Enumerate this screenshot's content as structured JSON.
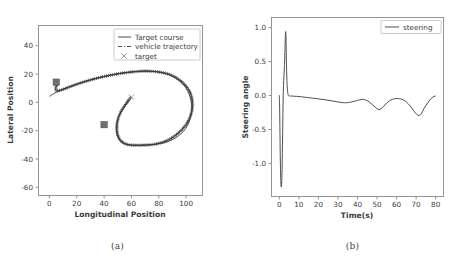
{
  "figure": {
    "panels": [
      {
        "caption": "(a)",
        "chart_data": {
          "type": "line",
          "title": "",
          "xlabel": "Longitudinal Position",
          "ylabel": "Lateral Position",
          "xlim": [
            -8,
            112
          ],
          "ylim": [
            -70,
            50
          ],
          "xticks": [
            0,
            20,
            40,
            60,
            80,
            100
          ],
          "yticks": [
            -60,
            -40,
            -20,
            0,
            20,
            40
          ],
          "grid": false,
          "legend_position": "upper right",
          "legend": [
            "Target course",
            "vehicle trajectory",
            "target"
          ],
          "series": [
            {
              "name": "Target course",
              "style": "solid",
              "x": [
                0,
                2,
                4,
                6,
                8,
                10,
                14,
                18,
                22,
                26,
                30,
                34,
                38,
                42,
                46,
                50,
                54,
                58,
                62,
                66,
                70,
                74,
                78,
                82,
                86,
                90,
                94,
                98,
                101,
                103,
                104,
                104,
                103,
                101,
                98,
                94,
                90,
                86,
                82,
                78,
                74,
                70,
                66,
                62,
                58,
                55,
                52,
                50,
                49,
                49,
                50,
                52,
                55,
                58,
                60
              ],
              "y": [
                0,
                1.2,
                2.4,
                3.4,
                4.3,
                5.1,
                6.6,
                8.0,
                9.3,
                10.5,
                11.6,
                12.6,
                13.5,
                14.4,
                15.2,
                15.9,
                16.5,
                17.0,
                17.4,
                17.7,
                17.8,
                17.7,
                17.4,
                16.8,
                15.8,
                14.2,
                11.8,
                8.2,
                4.0,
                -0.6,
                -5.4,
                -10.6,
                -15.8,
                -20.6,
                -24.8,
                -28.2,
                -30.6,
                -32.2,
                -33.2,
                -33.8,
                -34.2,
                -34.4,
                -34.5,
                -34.5,
                -34.3,
                -33.6,
                -32.0,
                -29.0,
                -25.0,
                -20.5,
                -16.0,
                -11.6,
                -7.4,
                -3.6,
                -0.6
              ]
            },
            {
              "name": "vehicle trajectory",
              "style": "dashed",
              "marker": "plus",
              "x": [
                5.5,
                5.0,
                4.6,
                4.6,
                5.2,
                6.4,
                8.0,
                10.0,
                13.0,
                16.5,
                20.0,
                24.0,
                28.0,
                32.0,
                36.0,
                40.0,
                44.0,
                48.0,
                52.0,
                56.0,
                60.0,
                64.0,
                68.0,
                72.0,
                76.0,
                80.0,
                84.0,
                88.0,
                92.0,
                96.0,
                99.5,
                102.5,
                104.2,
                104.8,
                104.2,
                102.5,
                100.0,
                96.5,
                92.5,
                88.5,
                84.5,
                80.5,
                76.5,
                72.5,
                68.5,
                64.5,
                60.5,
                57.0,
                54.0,
                51.5,
                50.0,
                49.3,
                49.5,
                50.6,
                52.5,
                55.0,
                57.5,
                59.5
              ],
              "y": [
                8.6,
                7.2,
                5.8,
                4.6,
                3.9,
                3.8,
                4.2,
                4.9,
                6.0,
                7.3,
                8.5,
                9.8,
                11.0,
                12.1,
                13.1,
                14.0,
                14.8,
                15.5,
                16.2,
                16.7,
                17.2,
                17.5,
                17.8,
                17.8,
                17.6,
                17.2,
                16.5,
                15.4,
                13.6,
                11.0,
                7.8,
                3.8,
                -0.8,
                -5.8,
                -10.8,
                -15.6,
                -20.0,
                -24.0,
                -27.4,
                -30.0,
                -31.9,
                -33.1,
                -33.9,
                -34.3,
                -34.5,
                -34.6,
                -34.5,
                -34.0,
                -32.8,
                -30.6,
                -27.4,
                -23.4,
                -19.0,
                -14.6,
                -10.4,
                -6.6,
                -3.2,
                -0.6
              ]
            }
          ],
          "point_markers": [
            {
              "name": "target",
              "marker": "x",
              "x": 60,
              "y": -0.6
            }
          ],
          "obstacles": [
            {
              "marker": "square",
              "x": 5,
              "y": 10
            },
            {
              "marker": "square",
              "x": 40,
              "y": -20
            }
          ]
        }
      },
      {
        "caption": "(b)",
        "chart_data": {
          "type": "line",
          "title": "",
          "xlabel": "Time(s)",
          "ylabel": "Steering angle",
          "xlim": [
            -4,
            84
          ],
          "ylim": [
            -1.5,
            1.15
          ],
          "xticks": [
            0,
            10,
            20,
            30,
            40,
            50,
            60,
            70,
            80
          ],
          "yticks": [
            -1.0,
            -0.5,
            0.0,
            0.5,
            1.0
          ],
          "ytick_labels": [
            "-1.0",
            "-0.5",
            "0.0",
            "0.5",
            "1.0"
          ],
          "grid": false,
          "legend_position": "upper right",
          "legend": [
            "steering"
          ],
          "series": [
            {
              "name": "steering",
              "style": "solid",
              "x": [
                0.0,
                0.2,
                0.4,
                0.6,
                0.8,
                1.0,
                1.2,
                1.4,
                1.6,
                1.8,
                2.0,
                2.2,
                2.4,
                2.6,
                2.8,
                3.0,
                3.2,
                3.4,
                3.6,
                3.8,
                4.0,
                4.4,
                4.8,
                5.2,
                5.6,
                6.0,
                7.0,
                8.0,
                10.0,
                13.0,
                16.0,
                20.0,
                24.0,
                28.0,
                31.0,
                33.5,
                35.0,
                37.0,
                39.0,
                41.0,
                42.5,
                44.0,
                46.0,
                48.0,
                50.0,
                51.0,
                52.5,
                54.0,
                56.0,
                58.0,
                60.0,
                62.0,
                63.5,
                65.0,
                67.0,
                69.0,
                70.5,
                71.5,
                72.5,
                74.0,
                76.0,
                78.0,
                80.0
              ],
              "y": [
                0.0,
                -0.25,
                -0.72,
                -1.1,
                -1.3,
                -1.36,
                -1.3,
                -1.1,
                -0.75,
                -0.35,
                0.0,
                0.18,
                0.3,
                0.42,
                0.58,
                0.8,
                0.94,
                0.86,
                0.55,
                0.3,
                0.14,
                0.02,
                -0.01,
                -0.012,
                -0.012,
                -0.012,
                -0.014,
                -0.016,
                -0.02,
                -0.03,
                -0.04,
                -0.055,
                -0.07,
                -0.09,
                -0.105,
                -0.112,
                -0.11,
                -0.1,
                -0.085,
                -0.07,
                -0.062,
                -0.07,
                -0.1,
                -0.15,
                -0.2,
                -0.215,
                -0.19,
                -0.145,
                -0.09,
                -0.06,
                -0.05,
                -0.055,
                -0.07,
                -0.1,
                -0.16,
                -0.24,
                -0.29,
                -0.3,
                -0.28,
                -0.2,
                -0.11,
                -0.04,
                -0.01
              ]
            }
          ]
        }
      }
    ]
  }
}
